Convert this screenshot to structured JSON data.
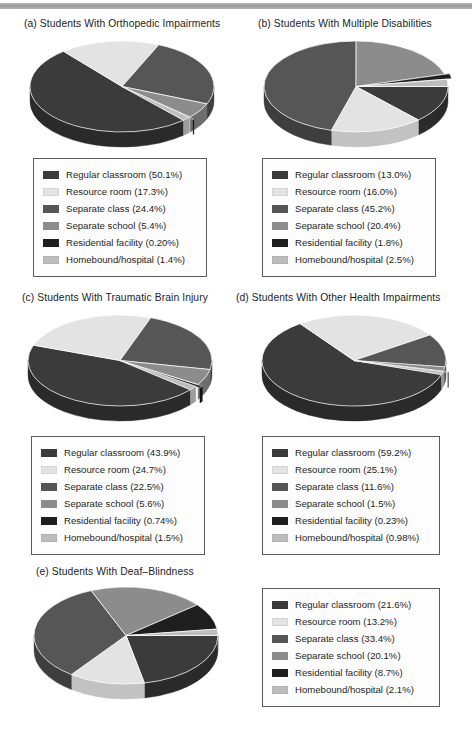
{
  "figure": {
    "background": "#ffffff",
    "scan_artifact_bar": "#a2a2a2",
    "series_names": [
      "Regular classroom",
      "Resource room",
      "Separate class",
      "Separate school",
      "Residential facility",
      "Homebound/hospital"
    ],
    "series_colors": [
      "#3b3b3b",
      "#e3e3e3",
      "#565656",
      "#8c8c8c",
      "#1e1e1e",
      "#bdbdbd"
    ],
    "series_side_colors": [
      "#2a2a2a",
      "#c2c2c2",
      "#3e3e3e",
      "#6d6d6d",
      "#121212",
      "#9d9d9d"
    ]
  },
  "panels": [
    {
      "key": "a",
      "title": "(a) Students With Orthopedic Impairments",
      "legend": [
        {
          "label": "Regular classroom (50.1%)",
          "color": "#3b3b3b"
        },
        {
          "label": "Resource room (17.3%)",
          "color": "#e3e3e3"
        },
        {
          "label": "Separate class (24.4%)",
          "color": "#565656"
        },
        {
          "label": "Separate school (5.4%)",
          "color": "#8c8c8c"
        },
        {
          "label": "Residential facility (0.20%)",
          "color": "#1e1e1e"
        },
        {
          "label": "Homebound/hospital (1.4%)",
          "color": "#bdbdbd"
        }
      ]
    },
    {
      "key": "b",
      "title": "(b) Students With Multiple Disabilities",
      "legend": [
        {
          "label": "Regular classroom (13.0%)",
          "color": "#3b3b3b"
        },
        {
          "label": "Resource room (16.0%)",
          "color": "#e3e3e3"
        },
        {
          "label": "Separate class (45.2%)",
          "color": "#565656"
        },
        {
          "label": "Separate school (20.4%)",
          "color": "#8c8c8c"
        },
        {
          "label": "Residential facility (1.8%)",
          "color": "#1e1e1e"
        },
        {
          "label": "Homebound/hospital (2.5%)",
          "color": "#bdbdbd"
        }
      ]
    },
    {
      "key": "c",
      "title": "(c) Students With Traumatic Brain Injury",
      "legend": [
        {
          "label": "Regular classroom (43.9%)",
          "color": "#3b3b3b"
        },
        {
          "label": "Resource room (24.7%)",
          "color": "#e3e3e3"
        },
        {
          "label": "Separate class (22.5%)",
          "color": "#565656"
        },
        {
          "label": "Separate school (5.6%)",
          "color": "#8c8c8c"
        },
        {
          "label": "Residential facility (0.74%)",
          "color": "#1e1e1e"
        },
        {
          "label": "Homebound/hospital (1.5%)",
          "color": "#bdbdbd"
        }
      ]
    },
    {
      "key": "d",
      "title": "(d) Students With Other Health Impairments",
      "legend": [
        {
          "label": "Regular classroom (59.2%)",
          "color": "#3b3b3b"
        },
        {
          "label": "Resource room (25.1%)",
          "color": "#e3e3e3"
        },
        {
          "label": "Separate class (11.6%)",
          "color": "#565656"
        },
        {
          "label": "Separate school (1.5%)",
          "color": "#8c8c8c"
        },
        {
          "label": "Residential facility (0.23%)",
          "color": "#1e1e1e"
        },
        {
          "label": "Homebound/hospital (0.98%)",
          "color": "#bdbdbd"
        }
      ]
    },
    {
      "key": "e",
      "title": "(e) Students With Deaf–Blindness",
      "legend": [
        {
          "label": "Regular classroom (21.6%)",
          "color": "#3b3b3b"
        },
        {
          "label": "Resource room (13.2%)",
          "color": "#e3e3e3"
        },
        {
          "label": "Separate class (33.4%)",
          "color": "#565656"
        },
        {
          "label": "Separate school (20.1%)",
          "color": "#8c8c8c"
        },
        {
          "label": "Residential facility (8.7%)",
          "color": "#1e1e1e"
        },
        {
          "label": "Homebound/hospital (2.1%)",
          "color": "#bdbdbd"
        }
      ]
    }
  ],
  "chart_data": [
    {
      "type": "pie",
      "title": "(a) Students With Orthopedic Impairments",
      "labels": [
        "Regular classroom",
        "Resource room",
        "Separate class",
        "Separate school",
        "Residential facility",
        "Homebound/hospital"
      ],
      "values": [
        50.1,
        17.3,
        24.4,
        5.4,
        0.2,
        1.4
      ],
      "units": "percent",
      "legend_position": "below",
      "three_d": true,
      "start_angle": 48,
      "exploded_slices": [
        4
      ]
    },
    {
      "type": "pie",
      "title": "(b) Students With Multiple Disabilities",
      "labels": [
        "Regular classroom",
        "Resource room",
        "Separate class",
        "Separate school",
        "Residential facility",
        "Homebound/hospital"
      ],
      "values": [
        13.0,
        16.0,
        45.2,
        20.4,
        1.8,
        2.5
      ],
      "units": "percent",
      "legend_position": "below",
      "three_d": true,
      "start_angle": 0,
      "exploded_slices": [
        4
      ]
    },
    {
      "type": "pie",
      "title": "(c) Students With Traumatic Brain Injury",
      "labels": [
        "Regular classroom",
        "Resource room",
        "Separate class",
        "Separate school",
        "Residential facility",
        "Homebound/hospital"
      ],
      "values": [
        43.9,
        24.7,
        22.5,
        5.6,
        0.74,
        1.5
      ],
      "units": "percent",
      "legend_position": "below",
      "three_d": true,
      "start_angle": 40,
      "exploded_slices": [
        4
      ]
    },
    {
      "type": "pie",
      "title": "(d) Students With Other Health Impairments",
      "labels": [
        "Regular classroom",
        "Resource room",
        "Separate class",
        "Separate school",
        "Residential facility",
        "Homebound/hospital"
      ],
      "values": [
        59.2,
        25.1,
        11.6,
        1.5,
        0.23,
        0.98
      ],
      "units": "percent",
      "legend_position": "below",
      "three_d": true,
      "start_angle": 18,
      "exploded_slices": [
        4
      ]
    },
    {
      "type": "pie",
      "title": "(e) Students With Deaf–Blindness",
      "labels": [
        "Regular classroom",
        "Resource room",
        "Separate class",
        "Separate school",
        "Residential facility",
        "Homebound/hospital"
      ],
      "values": [
        21.6,
        13.2,
        33.4,
        20.1,
        8.7,
        2.1
      ],
      "units": "percent",
      "legend_position": "right",
      "three_d": true,
      "start_angle": 0,
      "exploded_slices": []
    }
  ]
}
